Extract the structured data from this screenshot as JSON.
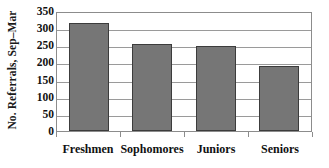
{
  "chart_data": {
    "type": "bar",
    "title": "",
    "xlabel": "",
    "ylabel": "No. Referrals, Sep–Mar",
    "categories": [
      "Freshmen",
      "Sophomores",
      "Juniors",
      "Seniors"
    ],
    "values": [
      315,
      255,
      248,
      190
    ],
    "series": [
      {
        "name": "No. Referrals, Sep–Mar",
        "values": [
          315,
          255,
          248,
          190
        ]
      }
    ],
    "ylim": [
      0,
      350
    ],
    "ytick_labels": [
      "0",
      "50",
      "100",
      "150",
      "200",
      "250",
      "300",
      "350"
    ],
    "ytick_values": [
      0,
      50,
      100,
      150,
      200,
      250,
      300,
      350
    ],
    "grid": "horizontal",
    "legend": "none",
    "bar_color": "#767676",
    "bar_edge_color": "#3c3c3c",
    "grid_color": "#9a9a9a",
    "frame_color": "#8c8c8c",
    "text_color": "#111111",
    "background": "#ffffff"
  }
}
